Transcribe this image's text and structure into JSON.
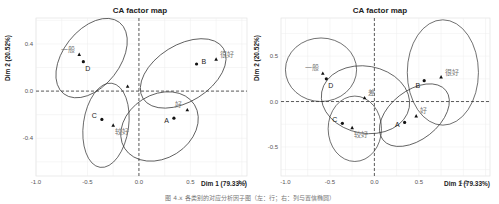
{
  "caption": "图 4.x  各类别的对应分析因子图（左：行；右：列与置信椭圆）",
  "chart_data": [
    {
      "type": "scatter",
      "title": "CA factor map",
      "xlabel": "Dim 1 (79.33%)",
      "ylabel": "Dim 2 (20.52%)",
      "xlim": [
        -1.0,
        1.05
      ],
      "ylim": [
        -0.72,
        0.62
      ],
      "xticks": [
        -1.0,
        -0.5,
        0.0,
        0.5,
        1.0
      ],
      "xtick_labels": [
        "-1.0",
        "-0.5",
        "0.0",
        "0.5",
        "1.0"
      ],
      "yticks": [
        -0.4,
        0.0,
        0.4
      ],
      "ytick_labels": [
        "-0.4",
        "0.0",
        "0.4"
      ],
      "grid": true,
      "rows": [
        {
          "label": "A",
          "x": 0.34,
          "y": -0.23
        },
        {
          "label": "B",
          "x": 0.56,
          "y": 0.23
        },
        {
          "label": "C",
          "x": -0.36,
          "y": -0.24
        },
        {
          "label": "D",
          "x": -0.54,
          "y": 0.25
        }
      ],
      "columns": [
        {
          "label": "很好",
          "x": 0.75,
          "y": 0.27
        },
        {
          "label": "好",
          "x": 0.47,
          "y": -0.16
        },
        {
          "label": "较好",
          "x": -0.25,
          "y": -0.29
        },
        {
          "label": "一般",
          "x": -0.58,
          "y": 0.31
        },
        {
          "label": "差",
          "x": -0.11,
          "y": 0.04
        }
      ],
      "ellipses": [
        {
          "group": "D",
          "cx": -0.46,
          "cy": 0.28,
          "rx": 0.44,
          "ry": 0.24,
          "angle_deg": -52
        },
        {
          "group": "C",
          "cx": -0.32,
          "cy": -0.29,
          "rx": 0.22,
          "ry": 0.36,
          "angle_deg": 8
        },
        {
          "group": "B",
          "cx": 0.43,
          "cy": 0.15,
          "rx": 0.46,
          "ry": 0.24,
          "angle_deg": -32
        },
        {
          "group": "A",
          "cx": 0.2,
          "cy": -0.3,
          "rx": 0.4,
          "ry": 0.27,
          "angle_deg": -32
        }
      ]
    },
    {
      "type": "scatter",
      "title": "CA factor map",
      "xlabel": "Dim 1 (79.33%)",
      "ylabel": "Dim 2 (20.52%)",
      "xlim": [
        -1.05,
        1.3
      ],
      "ylim": [
        -0.82,
        0.92
      ],
      "xticks": [
        -1.0,
        -0.5,
        0.0,
        0.5,
        1.0
      ],
      "xtick_labels": [
        "-1.0",
        "-0.5",
        "0.0",
        "0.5",
        "1.0"
      ],
      "yticks": [
        -0.5,
        0.0,
        0.5
      ],
      "ytick_labels": [
        "-0.5",
        "0.0",
        "0.5"
      ],
      "grid": true,
      "rows": [
        {
          "label": "A",
          "x": 0.34,
          "y": -0.23
        },
        {
          "label": "B",
          "x": 0.56,
          "y": 0.23
        },
        {
          "label": "C",
          "x": -0.36,
          "y": -0.24
        },
        {
          "label": "D",
          "x": -0.54,
          "y": 0.25
        }
      ],
      "columns": [
        {
          "label": "很好",
          "x": 0.75,
          "y": 0.27
        },
        {
          "label": "好",
          "x": 0.47,
          "y": -0.16
        },
        {
          "label": "较好",
          "x": -0.25,
          "y": -0.29
        },
        {
          "label": "一般",
          "x": -0.58,
          "y": 0.31
        },
        {
          "label": "差",
          "x": -0.11,
          "y": 0.04
        }
      ],
      "ellipses": [
        {
          "group": "一般",
          "cx": -0.6,
          "cy": 0.35,
          "rx": 0.4,
          "ry": 0.35,
          "angle_deg": 0
        },
        {
          "group": "差",
          "cx": -0.1,
          "cy": 0.02,
          "rx": 0.5,
          "ry": 0.37,
          "angle_deg": 10
        },
        {
          "group": "较好",
          "cx": -0.22,
          "cy": -0.3,
          "rx": 0.3,
          "ry": 0.36,
          "angle_deg": 0
        },
        {
          "group": "很好",
          "cx": 0.77,
          "cy": 0.32,
          "rx": 0.4,
          "ry": 0.58,
          "angle_deg": 0
        },
        {
          "group": "好",
          "cx": 0.45,
          "cy": -0.15,
          "rx": 0.45,
          "ry": 0.27,
          "angle_deg": -38
        }
      ]
    }
  ]
}
